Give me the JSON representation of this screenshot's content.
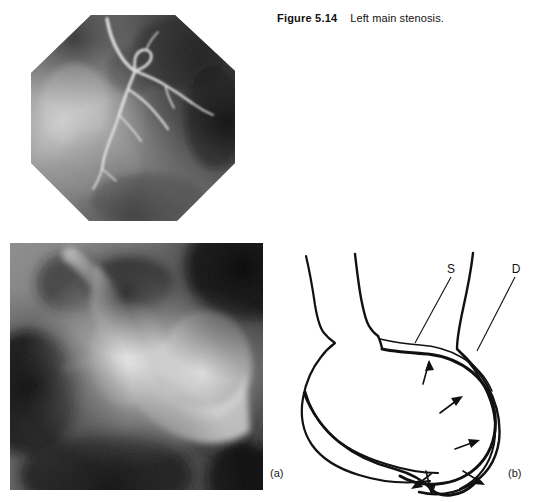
{
  "figure": {
    "number": "Figure 5.14",
    "title": "Left main stenosis.",
    "page_background": "#ffffff",
    "ink_color": "#111111"
  },
  "panels": [
    {
      "id": "top-angiogram",
      "kind": "coronary-angiogram",
      "shape": "octagonal",
      "label": "",
      "description": "Coronary angiogram, octagonal image intensifier field"
    },
    {
      "id": "panel-a",
      "kind": "coronary-angiogram",
      "shape": "rectangular",
      "label": "(a)",
      "description": "Magnified angiogram of left main coronary artery"
    },
    {
      "id": "panel-b",
      "kind": "line-drawing",
      "shape": "rectangular",
      "label": "(b)",
      "description": "Line diagram of the vessel outline with stenosis arrows"
    }
  ],
  "drawing": {
    "leader_labels": [
      {
        "name": "S",
        "text": "S",
        "x": 172,
        "y": 28,
        "tip_x": 133,
        "tip_y": 96
      },
      {
        "name": "D",
        "text": "D",
        "x": 235,
        "y": 28,
        "tip_x": 193,
        "tip_y": 105
      }
    ],
    "arrow_count": 6,
    "arrows": [
      {
        "tail_x": 178,
        "tail_y": 125,
        "tip_x": 186,
        "tip_y": 103
      },
      {
        "tail_x": 194,
        "tail_y": 155,
        "tip_x": 215,
        "tip_y": 140
      },
      {
        "tail_x": 209,
        "tail_y": 197,
        "tip_x": 232,
        "tip_y": 190
      },
      {
        "tail_x": 186,
        "tail_y": 236,
        "tip_x": 168,
        "tip_y": 253
      },
      {
        "tail_x": 218,
        "tail_y": 232,
        "tip_x": 239,
        "tip_y": 245
      },
      {
        "tail_x": 177,
        "tail_y": 250,
        "tip_x": 182,
        "tip_y": 274
      }
    ]
  },
  "labels": {
    "panel_a": "(a)",
    "panel_b": "(b)"
  }
}
